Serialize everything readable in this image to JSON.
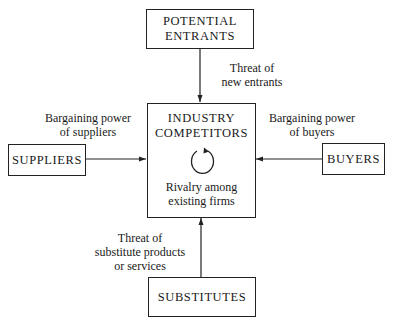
{
  "boxes": {
    "potential_entrants": {
      "line1": "POTENTIAL",
      "line2": "ENTRANTS"
    },
    "industry_competitors": {
      "line1": "INDUSTRY",
      "line2": "COMPETITORS",
      "sub1": "Rivalry among",
      "sub2": "existing firms"
    },
    "suppliers": {
      "label": "SUPPLIERS"
    },
    "buyers": {
      "label": "BUYERS"
    },
    "substitutes": {
      "label": "SUBSTITUTES"
    }
  },
  "forces": {
    "new_entrants": {
      "line1": "Threat of",
      "line2": "new entrants"
    },
    "suppliers": {
      "line1": "Bargaining power",
      "line2": "of suppliers"
    },
    "buyers": {
      "line1": "Bargaining power",
      "line2": "of buyers"
    },
    "substitutes": {
      "line1": "Threat of",
      "line2": "substitute products",
      "line3": "or services"
    }
  },
  "icons": {
    "rivalry": "circular-arrow-icon"
  },
  "colors": {
    "line": "#222222",
    "background": "#ffffff"
  }
}
